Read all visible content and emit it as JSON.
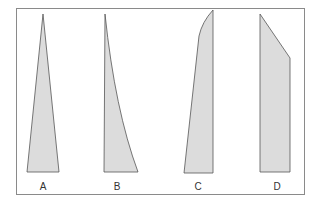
{
  "diagram": {
    "title": "",
    "colors": {
      "fill": "#dcdcdc",
      "stroke": "#555555",
      "frame": "#8a8a8a"
    },
    "shapes": [
      {
        "id": "A",
        "label": "A",
        "description": "narrow symmetric tapering triangle",
        "points": "43,14 59,172 27,172"
      },
      {
        "id": "B",
        "label": "B",
        "description": "taper with straight left edge and concave curved right edge",
        "path": "M105,14 L104,172 L138,172 Q115,110 105,14 Z"
      },
      {
        "id": "C",
        "label": "C",
        "description": "straight right edge, left edge slanted with rounded top",
        "path": "M213,10 L213,173 L184,173 L199,36 Q202,22 213,10 Z"
      },
      {
        "id": "D",
        "label": "D",
        "description": "rectangle with top-right corner cut diagonally",
        "points": "260,14 290,58 290,172 260,172"
      }
    ],
    "labels": [
      {
        "text": "A",
        "x": 43
      },
      {
        "text": "B",
        "x": 117
      },
      {
        "text": "C",
        "x": 198
      },
      {
        "text": "D",
        "x": 277
      }
    ]
  }
}
